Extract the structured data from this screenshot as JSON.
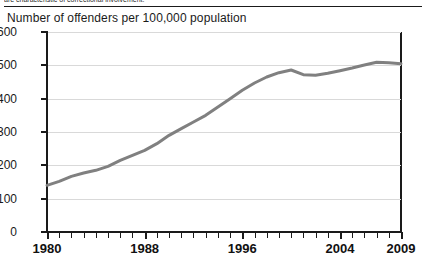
{
  "page": {
    "cropped_header_text": "are characteristic of correctional involvement."
  },
  "chart_data": {
    "type": "line",
    "title": "Number of offenders per 100,000 population",
    "xlabel": "",
    "ylabel": "",
    "xlim": [
      1980,
      2009
    ],
    "ylim": [
      0,
      600
    ],
    "grid": true,
    "legend": "none",
    "line_color": "#808080",
    "axis_color": "#1a1a1a",
    "gridline_color": "#d9d9d9",
    "yticks": [
      0,
      100,
      200,
      300,
      400,
      500,
      600
    ],
    "ytick_labels": [
      "0",
      "100",
      "200",
      "300",
      "400",
      "500",
      "600"
    ],
    "xticks": [
      1980,
      1981,
      1982,
      1983,
      1984,
      1985,
      1986,
      1987,
      1988,
      1989,
      1990,
      1991,
      1992,
      1993,
      1994,
      1995,
      1996,
      1997,
      1998,
      1999,
      2000,
      2001,
      2002,
      2003,
      2004,
      2005,
      2006,
      2007,
      2008,
      2009
    ],
    "xtick_labels": [
      "1980",
      "1988",
      "1996",
      "2004",
      "2009"
    ],
    "xtick_label_years": [
      1980,
      1988,
      1996,
      2004,
      2009
    ],
    "x": [
      1980,
      1981,
      1982,
      1983,
      1984,
      1985,
      1986,
      1987,
      1988,
      1989,
      1990,
      1991,
      1992,
      1993,
      1994,
      1995,
      1996,
      1997,
      1998,
      1999,
      2000,
      2001,
      2002,
      2003,
      2004,
      2005,
      2006,
      2007,
      2008,
      2009
    ],
    "values": [
      140,
      152,
      167,
      177,
      185,
      197,
      215,
      230,
      245,
      265,
      290,
      310,
      330,
      350,
      375,
      400,
      425,
      447,
      465,
      478,
      486,
      472,
      470,
      476,
      484,
      492,
      501,
      509,
      508,
      505
    ],
    "series": [
      {
        "name": "Offenders per 100,000 population",
        "values": [
          140,
          152,
          167,
          177,
          185,
          197,
          215,
          230,
          245,
          265,
          290,
          310,
          330,
          350,
          375,
          400,
          425,
          447,
          465,
          478,
          486,
          472,
          470,
          476,
          484,
          492,
          501,
          509,
          508,
          505
        ]
      }
    ]
  }
}
